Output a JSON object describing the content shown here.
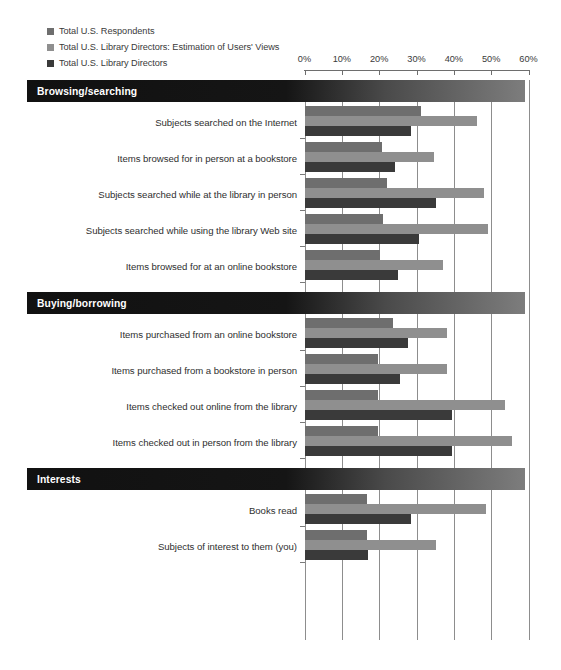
{
  "legend": {
    "items": [
      {
        "label": "Total U.S. Respondents",
        "color": "#6e6e6e"
      },
      {
        "label": "Total U.S. Library Directors: Estimation of Users' Views",
        "color": "#8f8f8f"
      },
      {
        "label": "Total U.S. Library Directors",
        "color": "#3a3a3a"
      }
    ]
  },
  "chart_data": {
    "type": "bar",
    "orientation": "horizontal",
    "title": "",
    "subtitle": "",
    "xlabel": "",
    "ylabel": "",
    "xlim": [
      0,
      60
    ],
    "xunit": "%",
    "grid": true,
    "legend_position": "top-left",
    "tick_labels": [
      "0%",
      "10%",
      "20%",
      "30%",
      "40%",
      "50%",
      "60%"
    ],
    "ticks": [
      0,
      10,
      20,
      30,
      40,
      50,
      60
    ],
    "series": [
      {
        "name": "Total U.S. Respondents",
        "color": "#6e6e6e"
      },
      {
        "name": "Total U.S. Library Directors: Estimation of Users' Views",
        "color": "#8f8f8f"
      },
      {
        "name": "Total U.S. Library Directors",
        "color": "#3a3a3a"
      }
    ],
    "sections": [
      {
        "title": "Browsing/searching",
        "categories": [
          "Subjects searched on the Internet",
          "Items browsed for in person at a bookstore",
          "Subjects searched while at the library in person",
          "Subjects searched while using the library Web site",
          "Items browsed for at an online bookstore"
        ],
        "values": [
          [
            31,
            46,
            28.5
          ],
          [
            20.5,
            34.5,
            24
          ],
          [
            22,
            48,
            35
          ],
          [
            21,
            49,
            30.5
          ],
          [
            20,
            37,
            25
          ]
        ]
      },
      {
        "title": "Buying/borrowing",
        "categories": [
          "Items purchased from an online bookstore",
          "Items purchased from a bookstore in person",
          "Items checked out online from the library",
          "Items checked out in person from the library"
        ],
        "values": [
          [
            23.5,
            38,
            27.5
          ],
          [
            19.5,
            38,
            25.5
          ],
          [
            19.5,
            53.5,
            39.5
          ],
          [
            19.5,
            55.5,
            39.5
          ]
        ]
      },
      {
        "title": "Interests",
        "categories": [
          "Books read",
          "Subjects of interest to them (you)"
        ],
        "values": [
          [
            16.5,
            48.5,
            28.5
          ],
          [
            16.5,
            35,
            17
          ]
        ]
      }
    ]
  }
}
